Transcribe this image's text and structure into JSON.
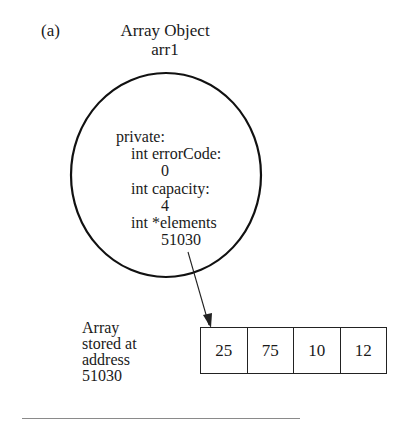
{
  "figure": {
    "label": "(a)",
    "title_line1": "Array Object",
    "title_line2": "arr1"
  },
  "object": {
    "access": "private:",
    "members": [
      {
        "decl": "int errorCode:",
        "value": "0"
      },
      {
        "decl": "int capacity:",
        "value": "4"
      },
      {
        "decl": "int *elements",
        "value": "51030"
      }
    ]
  },
  "array": {
    "caption_lines": [
      "Array",
      "stored at",
      "address",
      "51030"
    ],
    "cells": [
      "25",
      "75",
      "10",
      "12"
    ]
  },
  "colors": {
    "ink": "#1a1a1a",
    "rule": "#8a8a8a",
    "background": "#ffffff"
  }
}
